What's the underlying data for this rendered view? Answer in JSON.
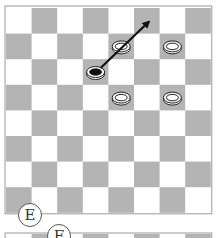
{
  "diagram": {
    "type": "checkers-board",
    "board_size": 8,
    "colors": {
      "light_square": "#ffffff",
      "dark_square": "#b4b4b4",
      "frame": "#9a9a9a",
      "white_piece": "#f4f4f4",
      "black_piece": "#111111",
      "arrow": "#111111"
    },
    "pieces": [
      {
        "color": "white",
        "row": 1,
        "col": 4
      },
      {
        "color": "white",
        "row": 1,
        "col": 6
      },
      {
        "color": "black",
        "row": 2,
        "col": 3
      },
      {
        "color": "white",
        "row": 3,
        "col": 4
      },
      {
        "color": "white",
        "row": 3,
        "col": 6
      }
    ],
    "arrow": {
      "from": {
        "row": 2,
        "col": 3
      },
      "to": {
        "row": 0,
        "col": 5
      }
    },
    "labels": {
      "panel_e": "E",
      "panel_f": "F"
    }
  }
}
